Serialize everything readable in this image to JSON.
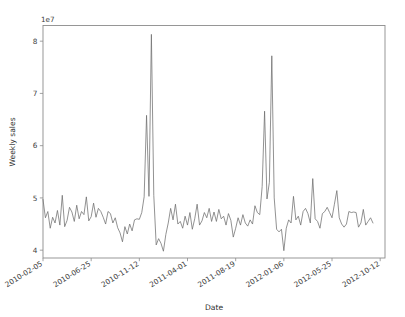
{
  "figure": {
    "background_color": "#ffffff",
    "line_color": "#6e6e6e",
    "axis_color": "#8c8c8c"
  },
  "chart_data": {
    "type": "line",
    "title": "",
    "xlabel": "Date",
    "ylabel": "Weekly sales",
    "y_offset_text": "1e7",
    "grid": false,
    "legend": null,
    "xlim": [
      0,
      142
    ],
    "ylim": [
      3.85,
      8.3
    ],
    "yticks": [
      4,
      5,
      6,
      7,
      8
    ],
    "ytick_labels": [
      "4",
      "5",
      "6",
      "7",
      "8"
    ],
    "xticks": [
      0,
      20,
      40,
      60,
      80,
      100,
      120,
      140
    ],
    "xtick_labels": [
      "2010-02-05",
      "2010-06-25",
      "2010-11-12",
      "2011-04-01",
      "2011-08-19",
      "2012-01-06",
      "2012-05-25",
      "2012-10-12"
    ],
    "series": [
      {
        "name": "Weekly sales",
        "units": "1e7",
        "values": [
          4.97,
          4.62,
          4.74,
          4.42,
          4.63,
          4.52,
          4.76,
          4.48,
          5.05,
          4.45,
          4.57,
          4.82,
          4.73,
          4.55,
          4.86,
          4.6,
          4.74,
          4.68,
          5.02,
          4.56,
          4.64,
          4.9,
          4.63,
          4.8,
          4.74,
          4.63,
          4.5,
          4.74,
          4.7,
          4.52,
          4.62,
          4.43,
          4.33,
          4.16,
          4.45,
          4.31,
          4.5,
          4.37,
          4.58,
          4.6,
          4.59,
          4.72,
          5.02,
          6.58,
          5.03,
          8.13,
          5.05,
          4.1,
          4.22,
          4.13,
          3.98,
          4.3,
          4.52,
          4.8,
          4.58,
          4.88,
          4.5,
          4.55,
          4.42,
          4.65,
          4.48,
          4.72,
          4.4,
          4.6,
          4.88,
          4.48,
          4.56,
          4.72,
          4.62,
          4.8,
          4.55,
          4.73,
          4.55,
          4.78,
          4.6,
          4.65,
          4.48,
          4.7,
          4.57,
          4.25,
          4.42,
          4.62,
          4.48,
          4.68,
          4.52,
          4.46,
          4.58,
          4.5,
          4.85,
          4.72,
          4.68,
          5.22,
          6.66,
          4.98,
          5.3,
          7.72,
          5.0,
          4.4,
          4.35,
          4.4,
          3.99,
          4.42,
          4.58,
          4.52,
          5.03,
          4.58,
          4.65,
          4.48,
          4.74,
          4.8,
          4.7,
          4.52,
          5.37,
          4.6,
          4.55,
          4.42,
          4.7,
          4.74,
          4.82,
          4.72,
          4.62,
          4.88,
          5.14,
          4.62,
          4.5,
          4.44,
          4.5,
          4.74,
          4.72,
          4.73,
          4.72,
          4.44,
          4.52,
          4.78,
          4.48,
          4.55,
          4.62,
          4.52
        ]
      }
    ]
  }
}
